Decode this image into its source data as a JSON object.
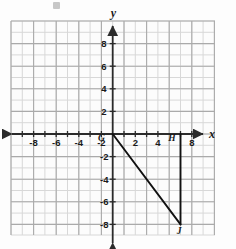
{
  "figure": {
    "kind": "coordinate-plane-diagram",
    "background_color": "#fdfdfd",
    "grid": {
      "minor_color": "#d6d6d6",
      "major_color": "#a8a8a8",
      "axis_color": "#2b2b2b",
      "x_min": -9,
      "x_max": -9,
      "x_range": [
        -9,
        9
      ],
      "y_range": [
        -9,
        9
      ],
      "cell_px": 11.3,
      "major_every": 2,
      "grid_on": true
    },
    "axes": {
      "x_axis_name": "x",
      "y_axis_name": "y",
      "x_tick_labels": [
        "-8",
        "-6",
        "-4",
        "-2",
        "2",
        "4",
        "8"
      ],
      "x_tick_values": [
        -8,
        -6,
        -4,
        -2,
        2,
        4,
        8
      ],
      "y_tick_labels": [
        "8",
        "6",
        "4",
        "2",
        "-2",
        "-4",
        "-6",
        "-8"
      ],
      "y_tick_values": [
        8,
        6,
        4,
        2,
        -2,
        -4,
        -6,
        -8
      ],
      "arrows": [
        "left",
        "right",
        "up",
        "down"
      ]
    },
    "shape": {
      "name": "right-triangle-GHJ",
      "stroke_color": "#111111",
      "stroke_width": 1.9,
      "vertices": [
        {
          "label": "G",
          "x": 0,
          "y": 0
        },
        {
          "label": "H",
          "x": 6,
          "y": 0
        },
        {
          "label": "J",
          "x": 6,
          "y": -8
        }
      ],
      "drawn_segments": [
        {
          "from": "G",
          "to": "J"
        },
        {
          "from": "H",
          "to": "J"
        }
      ]
    },
    "vertex_labels": [
      {
        "text": "G",
        "x": -0.95,
        "y": -0.55
      },
      {
        "text": "H",
        "x": 5.25,
        "y": -0.55
      },
      {
        "text": "J",
        "x": 5.85,
        "y": -8.85
      }
    ]
  }
}
